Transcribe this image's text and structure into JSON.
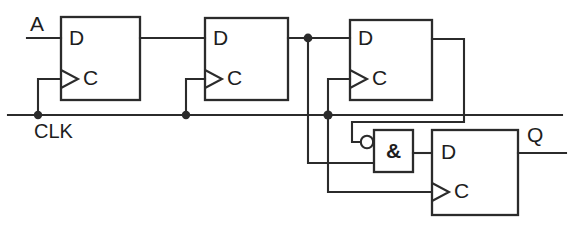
{
  "diagram": {
    "type": "digital-logic-schematic",
    "canvas": {
      "width": 577,
      "height": 227
    },
    "colors": {
      "background": "#ffffff",
      "wire": "#2b2b2b",
      "text": "#1d1d1d"
    },
    "signals": {
      "input_a": "A",
      "clock": "CLK",
      "output_q": "Q"
    },
    "flipflops": [
      {
        "id": "ff1",
        "d_label": "D",
        "c_label": "C",
        "x": 61,
        "y": 17,
        "w": 79,
        "h": 83,
        "edge_triggered": true
      },
      {
        "id": "ff2",
        "d_label": "D",
        "c_label": "C",
        "x": 205,
        "y": 18,
        "w": 83,
        "h": 82,
        "edge_triggered": true
      },
      {
        "id": "ff3",
        "d_label": "D",
        "c_label": "C",
        "x": 350,
        "y": 20,
        "w": 82,
        "h": 80,
        "edge_triggered": true
      },
      {
        "id": "ff4",
        "d_label": "D",
        "c_label": "C",
        "x": 432,
        "y": 130,
        "w": 86,
        "h": 85,
        "edge_triggered": true
      }
    ],
    "gates": [
      {
        "id": "and1",
        "symbol": "&",
        "type": "and-with-inverted-input",
        "x": 374,
        "y": 130,
        "w": 39,
        "h": 42,
        "inverting_bubble_input": "top"
      }
    ],
    "nets": [
      {
        "name": "a-to-ff1-d",
        "from": "A",
        "to": "ff1.D"
      },
      {
        "name": "ff1-q-to-ff2-d",
        "from": "ff1.Q",
        "to": "ff2.D"
      },
      {
        "name": "ff2-q-to-ff3-d",
        "from": "ff2.Q",
        "to": "ff3.D"
      },
      {
        "name": "ff2-q-branch-to-and",
        "from": "ff2.Q",
        "to": "and1.in-lower"
      },
      {
        "name": "ff3-q-feedback-to-and-bubble",
        "from": "ff3.Q",
        "to": "and1.in-upper-inverted"
      },
      {
        "name": "and-out-to-ff4-d",
        "from": "and1.out",
        "to": "ff4.D"
      },
      {
        "name": "ff4-q-out",
        "from": "ff4.Q",
        "to": "Q"
      },
      {
        "name": "clk-bus",
        "from": "CLK",
        "to": "ff1.C, ff2.C, ff3.C, ff4.C"
      }
    ],
    "junctions": [
      {
        "name": "clk-tap-ff1",
        "x": 38,
        "y": 115
      },
      {
        "name": "clk-tap-ff2",
        "x": 186,
        "y": 115
      },
      {
        "name": "clk-tap-ff3-ff4",
        "x": 328,
        "y": 115
      },
      {
        "name": "ff2-q-tap",
        "x": 308,
        "y": 38
      }
    ]
  }
}
